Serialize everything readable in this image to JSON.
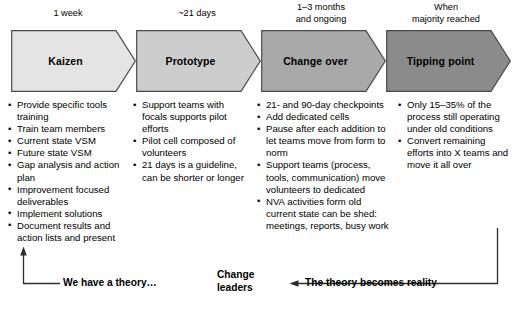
{
  "diagram": {
    "phases": [
      {
        "timing": "1 week",
        "name": "Kaizen",
        "fill": "#e4e4e4",
        "bullets": [
          "Provide specific tools training",
          "Train team members",
          "Current state VSM",
          "Future state VSM",
          "Gap analysis and action plan",
          "Improvement focused deliverables",
          "Implement solutions",
          "Document results and action lists and present"
        ]
      },
      {
        "timing": "~21 days",
        "name": "Prototype",
        "fill": "#cdcdcd",
        "bullets": [
          "Support teams with focals supports pilot efforts",
          "Pilot cell composed of volunteers",
          "21 days is a guideline, can be shorter or longer"
        ]
      },
      {
        "timing": "1–3 months\nand ongoing",
        "name": "Change over",
        "fill": "#a9a9a9",
        "bullets": [
          "21- and 90-day checkpoints",
          "Add dedicated cells",
          "Pause after each addition to let teams move from form to norm",
          "Support teams (process, tools, communication) move volunteers to dedicated",
          "NVA activities form old current state can be shed: meetings, reports, busy work"
        ]
      },
      {
        "timing": "When\nmajority reached",
        "name": "Tipping point",
        "fill": "#8b8b8b",
        "bullets": [
          "Only 15–35% of the process still operating under old conditions",
          "Convert remaining efforts into X teams and move it all over"
        ]
      }
    ],
    "footer": {
      "left_caption": "We have a theory…",
      "center_caption": "Change\nleaders",
      "right_caption": "The theory becomes reality",
      "left_arrow_icon": "up-arrow-icon",
      "right_arrow_icon": "left-arrow-icon"
    },
    "colors": {
      "outline": "#4a4a4a",
      "text": "#000000",
      "background": "#ffffff"
    }
  }
}
